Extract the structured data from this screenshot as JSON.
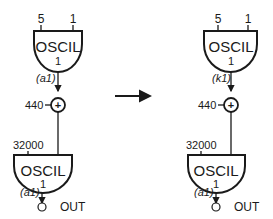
{
  "left": {
    "osc1": {
      "name": "OSCIL",
      "table": "1",
      "amp": "5",
      "freq": "1",
      "out": "(a1)"
    },
    "adder": {
      "value": "440",
      "symbol": "+"
    },
    "osc2": {
      "name": "OSCIL",
      "table": "1",
      "amp": "32000",
      "out": "(a1)"
    },
    "output": "OUT"
  },
  "right": {
    "osc1": {
      "name": "OSCIL",
      "table": "1",
      "amp": "5",
      "freq": "1",
      "out": "(k1)"
    },
    "adder": {
      "value": "440",
      "symbol": "+"
    },
    "osc2": {
      "name": "OSCIL",
      "table": "1",
      "amp": "32000",
      "out": "(a1)"
    },
    "output": "OUT"
  },
  "arrow": "transform-arrow",
  "colors": {
    "stroke": "#1a1a1a",
    "background": "#ffffff"
  }
}
